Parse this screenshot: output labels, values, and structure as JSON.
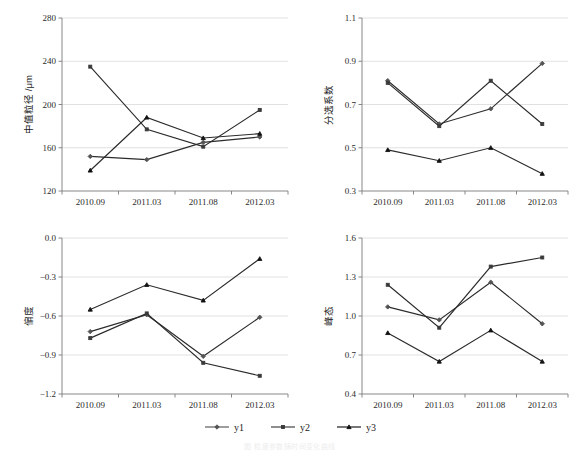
{
  "figure": {
    "width": 580,
    "height": 457,
    "background": "#ffffff",
    "line_color": "#2b2b2b",
    "grid_color": "#d9d9d9",
    "axis_color": "#7a7a7a"
  },
  "legend": {
    "position": "bottom-center",
    "entries": [
      {
        "name": "y1",
        "label": "y1",
        "marker": "diamond",
        "color": "#545454"
      },
      {
        "name": "y2",
        "label": "y2",
        "marker": "square",
        "color": "#3a3a3a"
      },
      {
        "name": "y3",
        "label": "y3",
        "marker": "triangle",
        "color": "#121212"
      }
    ]
  },
  "caption": {
    "text": "图 粒度参数随时间变化曲线"
  },
  "chart_data": [
    {
      "id": "median-grain-size",
      "type": "line",
      "title": "",
      "xlabel": "",
      "ylabel": "中值粒径 /μm",
      "categories": [
        "2010.09",
        "2011.03",
        "2011.08",
        "2012.03"
      ],
      "ylim": [
        120,
        280
      ],
      "yticks": [
        120,
        160,
        200,
        240,
        280
      ],
      "ytick_labels": [
        "120",
        "160",
        "200",
        "240",
        "280"
      ],
      "grid": true,
      "legend_position": "none",
      "series": [
        {
          "name": "y1",
          "marker": "diamond",
          "values": [
            152,
            149,
            165,
            170
          ]
        },
        {
          "name": "y2",
          "marker": "square",
          "values": [
            235,
            177,
            161,
            195
          ]
        },
        {
          "name": "y3",
          "marker": "triangle",
          "values": [
            139,
            188,
            169,
            173
          ]
        }
      ]
    },
    {
      "id": "sorting-coefficient",
      "type": "line",
      "title": "",
      "xlabel": "",
      "ylabel": "分选系数",
      "categories": [
        "2010.09",
        "2011.03",
        "2011.08",
        "2012.03"
      ],
      "ylim": [
        0.3,
        1.1
      ],
      "yticks": [
        0.3,
        0.5,
        0.7,
        0.9,
        1.1
      ],
      "ytick_labels": [
        "0.3",
        "0.5",
        "0.7",
        "0.9",
        "1.1"
      ],
      "grid": true,
      "legend_position": "none",
      "series": [
        {
          "name": "y1",
          "marker": "diamond",
          "values": [
            0.81,
            0.61,
            0.68,
            0.89
          ]
        },
        {
          "name": "y2",
          "marker": "square",
          "values": [
            0.8,
            0.6,
            0.81,
            0.61
          ]
        },
        {
          "name": "y3",
          "marker": "triangle",
          "values": [
            0.49,
            0.44,
            0.5,
            0.38
          ]
        }
      ]
    },
    {
      "id": "skewness",
      "type": "line",
      "title": "",
      "xlabel": "",
      "ylabel": "偏度",
      "categories": [
        "2010.09",
        "2011.03",
        "2011.08",
        "2012.03"
      ],
      "ylim": [
        -1.2,
        0.0
      ],
      "yticks": [
        -1.2,
        -0.9,
        -0.6,
        -0.3,
        0.0
      ],
      "ytick_labels": [
        "−1.2",
        "−0.9",
        "−0.6",
        "−0.3",
        "0.0"
      ],
      "grid": true,
      "legend_position": "none",
      "series": [
        {
          "name": "y1",
          "marker": "diamond",
          "values": [
            -0.72,
            -0.59,
            -0.91,
            -0.61
          ]
        },
        {
          "name": "y2",
          "marker": "square",
          "values": [
            -0.77,
            -0.58,
            -0.96,
            -1.06
          ]
        },
        {
          "name": "y3",
          "marker": "triangle",
          "values": [
            -0.55,
            -0.36,
            -0.48,
            -0.16
          ]
        }
      ]
    },
    {
      "id": "kurtosis",
      "type": "line",
      "title": "",
      "xlabel": "",
      "ylabel": "峰态",
      "categories": [
        "2010.09",
        "2011.03",
        "2011.08",
        "2012.03"
      ],
      "ylim": [
        0.4,
        1.6
      ],
      "yticks": [
        0.4,
        0.7,
        1.0,
        1.3,
        1.6
      ],
      "ytick_labels": [
        "0.4",
        "0.7",
        "1.0",
        "1.3",
        "1.6"
      ],
      "grid": true,
      "legend_position": "none",
      "series": [
        {
          "name": "y1",
          "marker": "diamond",
          "values": [
            1.07,
            0.97,
            1.26,
            0.94
          ]
        },
        {
          "name": "y2",
          "marker": "square",
          "values": [
            1.24,
            0.91,
            1.38,
            1.45
          ]
        },
        {
          "name": "y3",
          "marker": "triangle",
          "values": [
            0.87,
            0.65,
            0.89,
            0.65
          ]
        }
      ]
    }
  ]
}
